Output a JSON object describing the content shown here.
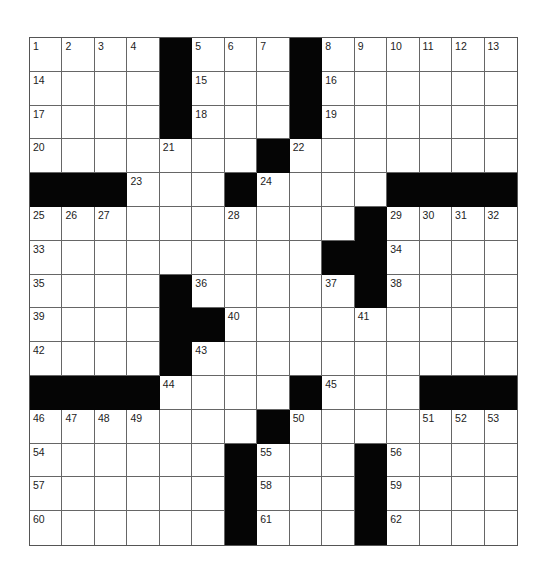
{
  "puzzle": {
    "rows": 15,
    "cols": 15,
    "grid": [
      [
        "1",
        "2",
        "3",
        "4",
        "#",
        "5",
        "6",
        "7",
        "#",
        "8",
        "9",
        "10",
        "11",
        "12",
        "13"
      ],
      [
        "14",
        "",
        "",
        "",
        "#",
        "15",
        "",
        "",
        "#",
        "16",
        "",
        "",
        "",
        "",
        ""
      ],
      [
        "17",
        "",
        "",
        "",
        "#",
        "18",
        "",
        "",
        "#",
        "19",
        "",
        "",
        "",
        "",
        ""
      ],
      [
        "20",
        "",
        "",
        "",
        "21",
        "",
        "",
        "#",
        "22",
        "",
        "",
        "",
        "",
        "",
        ""
      ],
      [
        "#",
        "#",
        "#",
        "23",
        "",
        "",
        "#",
        "24",
        "",
        "",
        "",
        "#",
        "#",
        "#",
        "#"
      ],
      [
        "25",
        "26",
        "27",
        "",
        "",
        "",
        "28",
        "",
        "",
        "",
        "#",
        "29",
        "30",
        "31",
        "32"
      ],
      [
        "33",
        "",
        "",
        "",
        "",
        "",
        "",
        "",
        "",
        "#",
        "#",
        "34",
        "",
        "",
        ""
      ],
      [
        "35",
        "",
        "",
        "",
        "#",
        "36",
        "",
        "",
        "",
        "37",
        "#",
        "38",
        "",
        "",
        ""
      ],
      [
        "39",
        "",
        "",
        "",
        "#",
        "#",
        "40",
        "",
        "",
        "",
        "41",
        "",
        "",
        "",
        ""
      ],
      [
        "42",
        "",
        "",
        "",
        "#",
        "43",
        "",
        "",
        "",
        "",
        "",
        "",
        "",
        "",
        ""
      ],
      [
        "#",
        "#",
        "#",
        "#",
        "44",
        "",
        "",
        "",
        "#",
        "45",
        "",
        "",
        "#",
        "#",
        "#"
      ],
      [
        "46",
        "47",
        "48",
        "49",
        "",
        "",
        "",
        "#",
        "50",
        "",
        "",
        "",
        "51",
        "52",
        "53"
      ],
      [
        "54",
        "",
        "",
        "",
        "",
        "",
        "#",
        "55",
        "",
        "",
        "#",
        "56",
        "",
        "",
        ""
      ],
      [
        "57",
        "",
        "",
        "",
        "",
        "",
        "#",
        "58",
        "",
        "",
        "#",
        "59",
        "",
        "",
        ""
      ],
      [
        "60",
        "",
        "",
        "",
        "",
        "",
        "#",
        "61",
        "",
        "",
        "#",
        "62",
        "",
        "",
        ""
      ]
    ],
    "colors": {
      "block": "#050505",
      "cell": "#ffffff",
      "grid_line": "#666666"
    }
  }
}
